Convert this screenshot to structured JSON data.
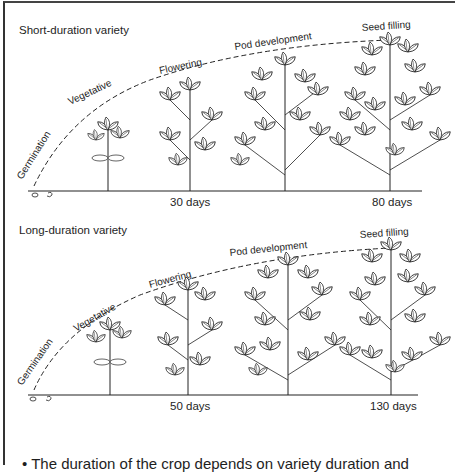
{
  "figure": {
    "panels": [
      {
        "title": "Short-duration variety",
        "stages": [
          "Germination",
          "Vegetative",
          "Flowering",
          "Pod development",
          "Seed filling"
        ],
        "day_labels": [
          "30 days",
          "80 days"
        ]
      },
      {
        "title": "Long-duration variety",
        "stages": [
          "Germination",
          "Vegetative",
          "Flowering",
          "Pod development",
          "Seed filling"
        ],
        "day_labels": [
          "50 days",
          "130 days"
        ]
      }
    ],
    "caption": "• The duration of the crop depends on variety duration and"
  },
  "colors": {
    "line": "#222222",
    "background": "#ffffff"
  }
}
